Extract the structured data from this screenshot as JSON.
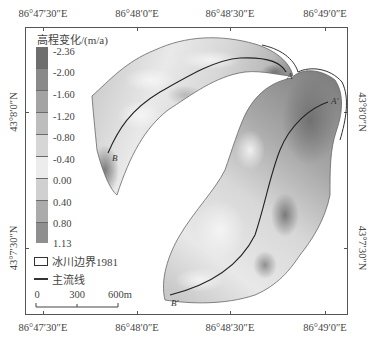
{
  "map": {
    "axes": {
      "top_ticks": [
        {
          "label": "86°47′30″E",
          "x": 43
        },
        {
          "label": "86°48′0″E",
          "x": 137
        },
        {
          "label": "86°48′30″E",
          "x": 230
        },
        {
          "label": "86°49′0″E",
          "x": 325
        }
      ],
      "bottom_ticks": [
        {
          "label": "86°47′30″E",
          "x": 43
        },
        {
          "label": "86°48′0″E",
          "x": 137
        },
        {
          "label": "86°48′30″E",
          "x": 230
        },
        {
          "label": "86°49′0″E",
          "x": 325
        }
      ],
      "left_ticks": [
        {
          "label": "43°8′0″N",
          "y": 112
        },
        {
          "label": "43°7′30″N",
          "y": 248
        }
      ],
      "right_ticks": [
        {
          "label": "43°8′0″N",
          "y": 112
        },
        {
          "label": "43°7′30″N",
          "y": 248
        }
      ]
    },
    "legend": {
      "title": "高程变化/(m/a)",
      "colorbar_labels": [
        "-2.36",
        "-2.00",
        "-1.60",
        "-1.20",
        "-0.80",
        "-0.40",
        "0.00",
        "0.40",
        "0.80",
        "1.13"
      ],
      "colorbar_colors": [
        "#6e6e6e",
        "#8a8a8a",
        "#a3a3a3",
        "#bdbdbd",
        "#d6d6d6",
        "#ececec",
        "#d0d0d0",
        "#ababab",
        "#8f8f8f"
      ],
      "boundary_label": "冰川边界1981",
      "flowline_label": "主流线"
    },
    "scale_bar": {
      "labels": [
        "0",
        "300",
        "600m"
      ]
    },
    "profile_labels": {
      "A": "A",
      "A_prime": "A′",
      "B": "B",
      "B_prime": "B′"
    }
  }
}
